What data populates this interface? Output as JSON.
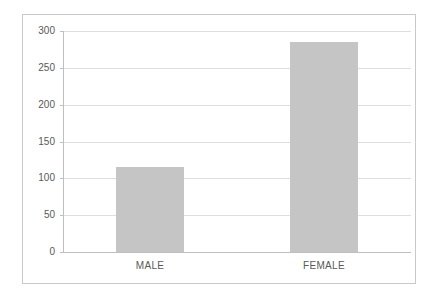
{
  "chart_data": {
    "type": "bar",
    "categories": [
      "MALE",
      "FEMALE"
    ],
    "values": [
      115,
      285
    ],
    "title": "",
    "xlabel": "",
    "ylabel": "",
    "ylim": [
      0,
      300
    ],
    "yticks": [
      0,
      50,
      100,
      150,
      200,
      250,
      300
    ],
    "grid": true,
    "legend": false,
    "bar_color": "#c5c5c5",
    "gridline_color": "#dedede",
    "axis_color": "#bfbfbf",
    "text_color": "#595959",
    "frame_border_color": "#c9c9c9",
    "background_color": "#ffffff"
  }
}
